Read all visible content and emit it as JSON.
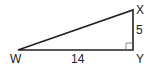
{
  "diagram": {
    "type": "right-triangle",
    "vertices": {
      "W": {
        "label": "W",
        "x": 18,
        "y": 50
      },
      "X": {
        "label": "X",
        "x": 133,
        "y": 10
      },
      "Y": {
        "label": "Y",
        "x": 133,
        "y": 50
      }
    },
    "sides": {
      "WY": {
        "label": "14"
      },
      "XY": {
        "label": "5"
      }
    },
    "right_angle_at": "Y",
    "stroke_color": "#222222"
  }
}
